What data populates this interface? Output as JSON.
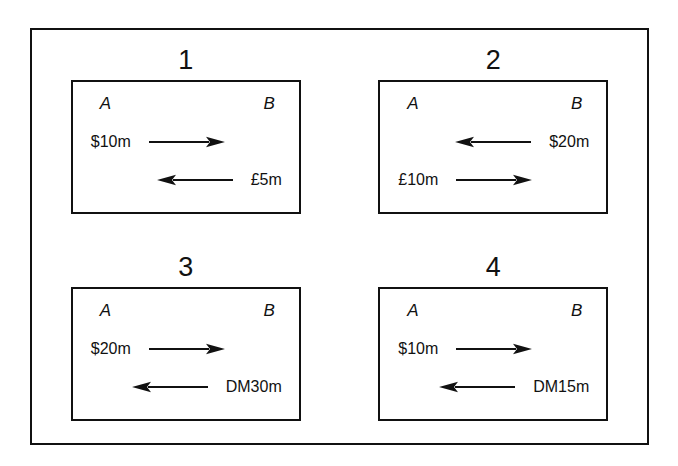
{
  "figure": {
    "endpoint_left_label": "A",
    "endpoint_right_label": "B",
    "line_color": "#111111",
    "background_color": "#ffffff",
    "panels": [
      {
        "number": "1",
        "endpoint_left": "A",
        "endpoint_right": "B",
        "rows": [
          {
            "label": "$10m",
            "direction": "right",
            "anchor": "left"
          },
          {
            "label": "£5m",
            "direction": "left",
            "anchor": "right"
          }
        ]
      },
      {
        "number": "2",
        "endpoint_left": "A",
        "endpoint_right": "B",
        "rows": [
          {
            "label": "$20m",
            "direction": "left",
            "anchor": "right"
          },
          {
            "label": "£10m",
            "direction": "right",
            "anchor": "left"
          }
        ]
      },
      {
        "number": "3",
        "endpoint_left": "A",
        "endpoint_right": "B",
        "rows": [
          {
            "label": "$20m",
            "direction": "right",
            "anchor": "left"
          },
          {
            "label": "DM30m",
            "direction": "left",
            "anchor": "right"
          }
        ]
      },
      {
        "number": "4",
        "endpoint_left": "A",
        "endpoint_right": "B",
        "rows": [
          {
            "label": "$10m",
            "direction": "right",
            "anchor": "left"
          },
          {
            "label": "DM15m",
            "direction": "left",
            "anchor": "right"
          }
        ]
      }
    ]
  }
}
